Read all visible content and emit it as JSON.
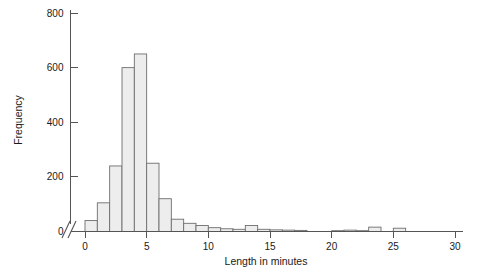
{
  "chart_data": {
    "type": "bar",
    "title": "",
    "subtitle": "",
    "xlabel": "Length in minutes",
    "ylabel": "Frequency",
    "xlim": [
      -1,
      30
    ],
    "ylim": [
      0,
      800
    ],
    "grid": false,
    "legend": null,
    "bin_width": 1,
    "axis_break": {
      "axis": "y",
      "symbol": "//",
      "note": "slash break mark drawn at origin of the vertical axis"
    },
    "x_ticks": [
      "0",
      "5",
      "10",
      "15",
      "20",
      "25",
      "30"
    ],
    "x_tick_values": [
      0,
      5,
      10,
      15,
      20,
      25,
      30
    ],
    "y_ticks": [
      "0",
      "200",
      "400",
      "600",
      "800"
    ],
    "y_tick_values": [
      0,
      200,
      400,
      600,
      800
    ],
    "bin_edges": [
      0,
      1,
      2,
      3,
      4,
      5,
      6,
      7,
      8,
      9,
      10,
      11,
      12,
      13,
      14,
      15,
      16,
      17,
      18,
      19,
      20,
      21,
      22,
      23,
      24,
      25,
      26
    ],
    "categories": [
      "0-1",
      "1-2",
      "2-3",
      "3-4",
      "4-5",
      "5-6",
      "6-7",
      "7-8",
      "8-9",
      "9-10",
      "10-11",
      "11-12",
      "12-13",
      "13-14",
      "14-15",
      "15-16",
      "16-17",
      "17-18",
      "18-19",
      "19-20",
      "20-21",
      "21-22",
      "22-23",
      "23-24",
      "24-25",
      "25-26"
    ],
    "values": [
      40,
      105,
      240,
      600,
      650,
      250,
      120,
      45,
      30,
      22,
      14,
      10,
      8,
      22,
      8,
      6,
      5,
      4,
      0,
      0,
      3,
      5,
      3,
      16,
      0,
      12
    ],
    "colors": {
      "bar_fill": "#ededed",
      "bar_stroke": "#6e6e6e",
      "axis": "#555555",
      "text": "#1a1a1a",
      "background": "#ffffff"
    }
  }
}
